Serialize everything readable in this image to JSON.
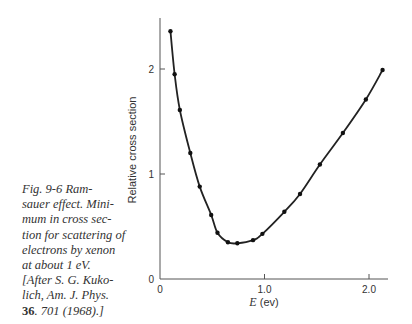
{
  "caption": {
    "lines": [
      "Fig. 9-6   Ram-",
      "sauer effect. Mini-",
      "mum in cross sec-",
      "tion for scattering of",
      "electrons by xenon",
      "at about 1 eV.",
      "[After S. G. Kuko-",
      "lich, Am. J. Phys."
    ],
    "last_line_bold": "36",
    "last_line_rest": ". 701 (1968).]"
  },
  "chart_data": {
    "type": "line",
    "title": "",
    "xlabel_italic": "E",
    "xlabel_rest": " (ev)",
    "xlabel": "E (ev)",
    "ylabel": "Relative cross section",
    "xlim": [
      0,
      2.2
    ],
    "ylim": [
      0,
      2.5
    ],
    "xticks": [
      0,
      1.0,
      2.0
    ],
    "xtick_labels": [
      "0",
      "1.0",
      "2.0"
    ],
    "yticks": [
      0,
      1,
      2
    ],
    "ytick_labels": [
      "0",
      "1",
      "2"
    ],
    "grid": false,
    "legend": null,
    "series": [
      {
        "name": "Xenon electron scattering",
        "markers": true,
        "smooth_curve": true,
        "x": [
          0.1,
          0.14,
          0.19,
          0.29,
          0.38,
          0.49,
          0.55,
          0.65,
          0.74,
          0.89,
          0.98,
          1.19,
          1.34,
          1.53,
          1.75,
          1.97,
          2.13
        ],
        "y": [
          2.36,
          1.95,
          1.61,
          1.2,
          0.88,
          0.61,
          0.44,
          0.35,
          0.34,
          0.37,
          0.43,
          0.64,
          0.81,
          1.09,
          1.39,
          1.71,
          1.99
        ]
      }
    ],
    "annotations": [
      "Minimum near 0.7 eV (Ramsauer effect)"
    ]
  }
}
